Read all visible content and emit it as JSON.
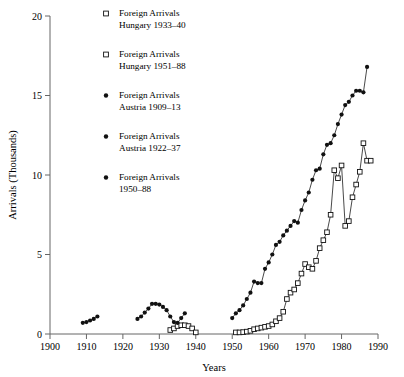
{
  "chart_data": {
    "type": "scatter",
    "title": "",
    "xlabel": "Years",
    "ylabel": "Arrivals (Thousands)",
    "xlim": [
      1900,
      1990
    ],
    "ylim": [
      0,
      20
    ],
    "xticks": [
      1900,
      1910,
      1920,
      1930,
      1940,
      1950,
      1960,
      1970,
      1980,
      1990
    ],
    "xtick_labels": [
      "1900",
      "1910",
      "1920",
      "1930",
      "1940",
      "1950",
      "1960",
      "1970",
      "1980",
      "1990"
    ],
    "yticks": [
      0,
      5,
      10,
      15,
      20
    ],
    "ytick_labels": [
      "0",
      "5",
      "10",
      "15",
      "20"
    ],
    "grid": false,
    "legend_position": "upper-left-inside",
    "series": [
      {
        "name": "Foreign Arrivals Hungary 1933–40",
        "marker": "open-square",
        "connected": false,
        "x": [
          1933,
          1934,
          1935,
          1936,
          1937,
          1938,
          1939,
          1940
        ],
        "y": [
          0.25,
          0.35,
          0.5,
          0.55,
          0.55,
          0.5,
          0.35,
          0.1
        ]
      },
      {
        "name": "Foreign Arrivals Hungary 1951–88",
        "marker": "open-square",
        "connected": true,
        "x": [
          1951,
          1952,
          1953,
          1954,
          1955,
          1956,
          1957,
          1958,
          1959,
          1960,
          1961,
          1962,
          1963,
          1964,
          1965,
          1966,
          1967,
          1968,
          1969,
          1970,
          1971,
          1972,
          1973,
          1974,
          1975,
          1976,
          1977,
          1978,
          1979,
          1980,
          1981,
          1982,
          1983,
          1984,
          1985,
          1986,
          1987,
          1988
        ],
        "y": [
          0.1,
          0.1,
          0.12,
          0.15,
          0.2,
          0.3,
          0.35,
          0.4,
          0.45,
          0.5,
          0.6,
          0.8,
          1.0,
          1.4,
          2.2,
          2.6,
          2.8,
          3.2,
          3.8,
          4.4,
          4.2,
          4.1,
          4.6,
          5.4,
          5.9,
          6.4,
          7.5,
          10.3,
          9.8,
          10.6,
          6.8,
          7.1,
          8.6,
          9.4,
          10.2,
          12.0,
          10.9,
          10.9
        ]
      },
      {
        "name": "Foreign Arrivals Austria 1909–13",
        "marker": "filled-circle",
        "connected": true,
        "x": [
          1909,
          1910,
          1911,
          1912,
          1913
        ],
        "y": [
          0.7,
          0.75,
          0.85,
          0.95,
          1.1
        ]
      },
      {
        "name": "Foreign Arrivals Austria 1922–37",
        "marker": "filled-circle",
        "connected": true,
        "x": [
          1924,
          1925,
          1926,
          1927,
          1928,
          1929,
          1930,
          1931,
          1932,
          1933,
          1934,
          1935,
          1936,
          1937
        ],
        "y": [
          0.95,
          1.1,
          1.35,
          1.6,
          1.9,
          1.9,
          1.85,
          1.7,
          1.5,
          1.1,
          0.75,
          0.7,
          1.0,
          1.3
        ]
      },
      {
        "name": "Foreign Arrivals 1950–88",
        "marker": "filled-circle",
        "connected": true,
        "x": [
          1950,
          1951,
          1952,
          1953,
          1954,
          1955,
          1956,
          1957,
          1958,
          1959,
          1960,
          1961,
          1962,
          1963,
          1964,
          1965,
          1966,
          1967,
          1968,
          1969,
          1970,
          1971,
          1972,
          1973,
          1974,
          1975,
          1976,
          1977,
          1978,
          1979,
          1980,
          1981,
          1982,
          1983,
          1984,
          1985,
          1986,
          1987
        ],
        "y": [
          1.0,
          1.3,
          1.5,
          1.8,
          2.2,
          2.6,
          3.3,
          3.2,
          3.2,
          4.1,
          4.5,
          5.0,
          5.6,
          5.8,
          6.2,
          6.5,
          6.8,
          7.1,
          7.0,
          7.8,
          8.4,
          8.9,
          9.7,
          10.3,
          10.4,
          11.3,
          11.9,
          12.0,
          12.5,
          13.2,
          13.8,
          14.4,
          14.6,
          15.0,
          15.3,
          15.3,
          15.2,
          16.8
        ]
      }
    ]
  },
  "legend": {
    "entries": [
      {
        "marker": "open-square",
        "line1": "Foreign Arrivals",
        "line2": "Hungary 1933–40"
      },
      {
        "marker": "open-square",
        "line1": "Foreign Arrivals",
        "line2": "Hungary 1951–88"
      },
      {
        "marker": "filled-circle",
        "line1": "Foreign Arrivals",
        "line2": "Austria 1909–13"
      },
      {
        "marker": "filled-circle",
        "line1": "Foreign Arrivals",
        "line2": "Austria 1922–37"
      },
      {
        "marker": "filled-circle",
        "line1": "Foreign Arrivals",
        "line2": "1950–88"
      }
    ]
  },
  "colors": {
    "marker": "#111111",
    "axis": "#666666",
    "background": "#ffffff"
  }
}
